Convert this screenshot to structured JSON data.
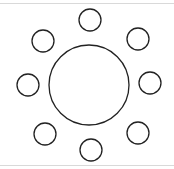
{
  "diagram": {
    "stroke_color": "#222222",
    "border_color": "#d9d9d9",
    "center_circle": {
      "cx": 89,
      "cy": 85,
      "r": 40
    },
    "satellite_circles": [
      {
        "cx": 90,
        "cy": 20,
        "r": 11
      },
      {
        "cx": 138,
        "cy": 39,
        "r": 11
      },
      {
        "cx": 150,
        "cy": 83,
        "r": 11
      },
      {
        "cx": 138,
        "cy": 133,
        "r": 11
      },
      {
        "cx": 91,
        "cy": 150,
        "r": 11
      },
      {
        "cx": 45,
        "cy": 134,
        "r": 11
      },
      {
        "cx": 28,
        "cy": 85,
        "r": 11
      },
      {
        "cx": 43,
        "cy": 41,
        "r": 11
      }
    ]
  }
}
